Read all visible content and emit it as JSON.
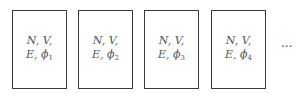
{
  "diagram": {
    "boxes": [
      {
        "line1": "N, V,",
        "line2_prefix": "E, ϕ",
        "subscript": "1"
      },
      {
        "line1": "N, V,",
        "line2_prefix": "E, ϕ",
        "subscript": "2"
      },
      {
        "line1": "N, V,",
        "line2_prefix": "E, ϕ",
        "subscript": "3"
      },
      {
        "line1": "N, V,",
        "line2_prefix": "E, ϕ",
        "subscript": "4"
      }
    ],
    "continuation": "···"
  }
}
